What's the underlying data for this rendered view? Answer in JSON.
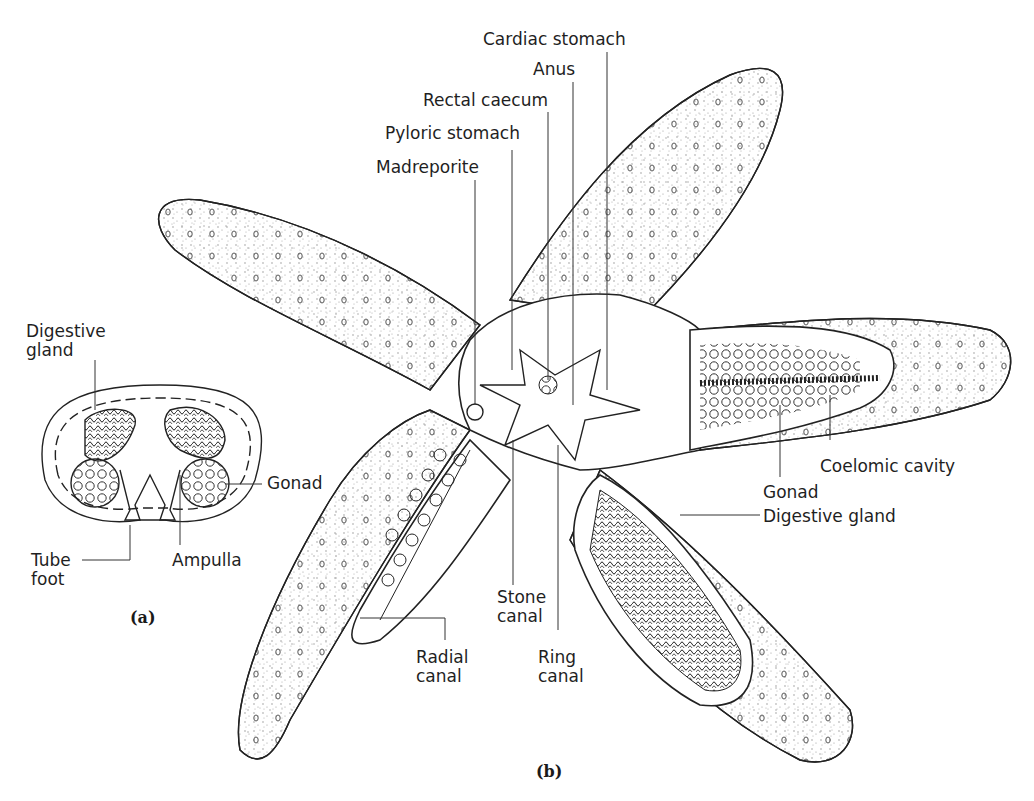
{
  "figure": {
    "panel_a": {
      "id": "(a)",
      "labels": {
        "digestive_gland_1": "Digestive",
        "digestive_gland_2": "gland",
        "gonad": "Gonad",
        "tube_foot_1": "Tube",
        "tube_foot_2": "foot",
        "ampulla": "Ampulla"
      }
    },
    "panel_b": {
      "id": "(b)",
      "labels": {
        "cardiac_stomach": "Cardiac stomach",
        "anus": "Anus",
        "rectal_caecum": "Rectal caecum",
        "pyloric_stomach": "Pyloric stomach",
        "madreporite": "Madreporite",
        "coelomic_cavity": "Coelomic cavity",
        "gonad": "Gonad",
        "digestive_gland": "Digestive gland",
        "stone_canal_1": "Stone",
        "stone_canal_2": "canal",
        "ring_canal_1": "Ring",
        "ring_canal_2": "canal",
        "radial_canal_1": "Radial",
        "radial_canal_2": "canal"
      }
    },
    "colors": {
      "ink": "#1f1f1f",
      "stipple": "#9a9a9a",
      "background": "#ffffff"
    }
  }
}
